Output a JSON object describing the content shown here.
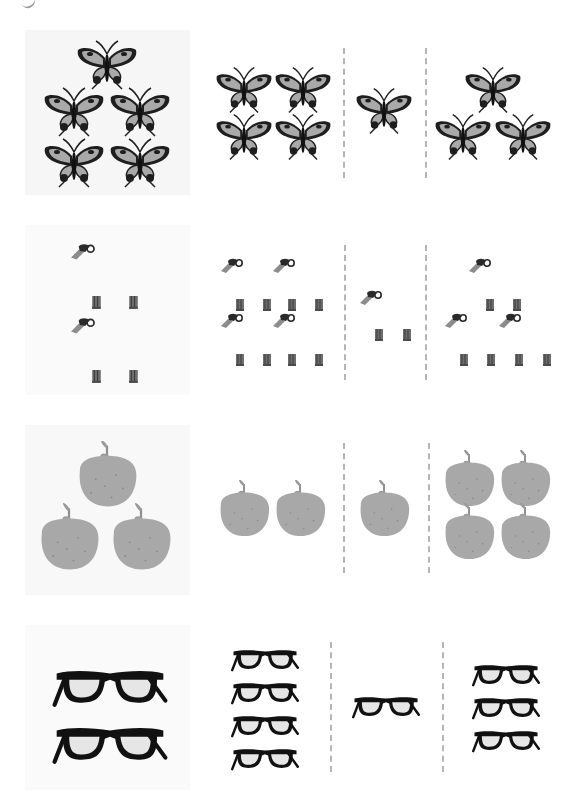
{
  "worksheet": {
    "type": "counting-match",
    "rows": [
      {
        "item": "butterfly",
        "reference_count": 5,
        "options": [
          {
            "label": "A",
            "count": 4
          },
          {
            "label": "B",
            "count": 1
          },
          {
            "label": "C",
            "count": 3
          }
        ]
      },
      {
        "item": "faucet-and-boots",
        "reference_count": 2,
        "options": [
          {
            "label": "A",
            "count": 4
          },
          {
            "label": "B",
            "count": 1
          },
          {
            "label": "C",
            "count": 3
          }
        ]
      },
      {
        "item": "orange",
        "reference_count": 3,
        "options": [
          {
            "label": "A",
            "count": 2
          },
          {
            "label": "B",
            "count": 1
          },
          {
            "label": "C",
            "count": 4
          }
        ]
      },
      {
        "item": "glasses",
        "reference_count": 2,
        "options": [
          {
            "label": "A",
            "count": 4
          },
          {
            "label": "B",
            "count": 1
          },
          {
            "label": "C",
            "count": 3
          }
        ]
      }
    ]
  },
  "colors": {
    "panel_bg": "#f6f6f6",
    "divider": "#b5b5b5",
    "butterfly_wing": "#a9a9a9",
    "butterfly_dark": "#1e1e1e",
    "orange_fill": "#a8a8a8",
    "glasses_frame": "#111111",
    "glasses_lens": "#e6e6e6"
  }
}
